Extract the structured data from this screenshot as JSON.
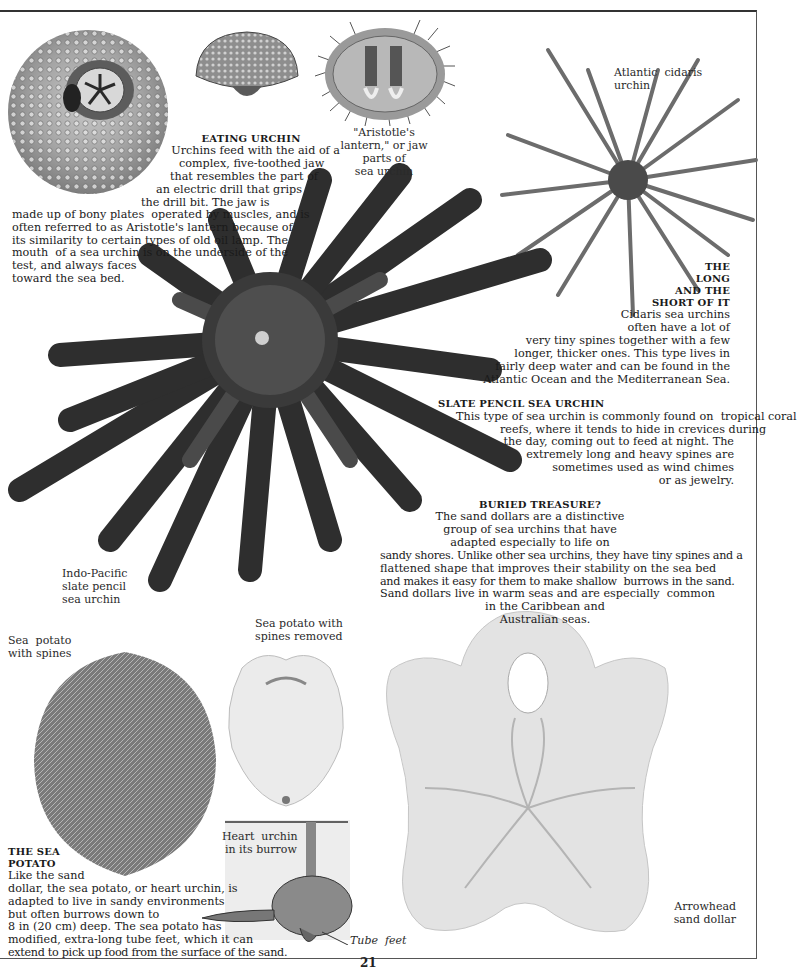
{
  "page": {
    "page_number": "21"
  },
  "eating_urchin": {
    "heading": "EATING URCHIN",
    "lines": [
      "Urchins feed with the aid of a",
      "complex, five-toothed jaw",
      "that resembles the part of",
      "an electric drill that grips",
      "the drill bit. The jaw is",
      "made up of bony plates  operated by muscles, and is",
      "often referred to as Aristotle's lantern because of",
      "its similarity to certain types of old oil lamp. The",
      "mouth  of a sea urchin is on the underside of the",
      "test, and always faces",
      "toward the sea bed."
    ]
  },
  "captions": {
    "aristotles_lantern": [
      "\"Aristotle's",
      "lantern,\" or jaw",
      "parts of",
      "sea urchin"
    ],
    "atlantic_cidaris": [
      "Atlantic  cidaris",
      "urchin"
    ],
    "indo_pacific": [
      "Indo-Pacific",
      "slate pencil",
      "sea urchin"
    ],
    "sea_potato_spines": [
      "Sea  potato",
      "with spines"
    ],
    "sea_potato_removed": [
      "Sea potato with",
      "spines removed"
    ],
    "heart_urchin": [
      "Heart  urchin",
      "in its burrow"
    ],
    "tube_feet": "Tube  feet",
    "arrowhead": [
      "Arrowhead",
      "sand dollar"
    ]
  },
  "long_and_short": {
    "heading": [
      "THE",
      "LONG",
      "AND THE",
      "SHORT OF IT"
    ],
    "lines": [
      "Cidaris sea urchins",
      "often have a lot of",
      "very tiny spines together with a few",
      "longer, thicker ones. This type lives in",
      "fairly deep water and can be found in the",
      "Atlantic Ocean and the Mediterranean Sea."
    ]
  },
  "slate_pencil": {
    "heading": "SLATE PENCIL SEA URCHIN",
    "lines": [
      "This type of sea urchin is commonly found on  tropical coral",
      "reefs, where it tends to hide in crevices during",
      "the day, coming out to feed at night. The",
      "extremely long and heavy spines are",
      "sometimes used as wind chimes",
      "or as jewelry."
    ]
  },
  "buried_treasure": {
    "heading": "BURIED TREASURE?",
    "lines": [
      "The sand dollars are a distinctive",
      "group of sea urchins that have",
      "adapted especially to life on",
      "sandy shores. Unlike other sea urchins, they have tiny spines and a",
      "flattened shape that improves their stability on the sea bed",
      "and makes it easy for them to make shallow  burrows in the sand.",
      "Sand dollars live in warm seas and are especially  common",
      "in the Caribbean and",
      "Australian seas."
    ]
  },
  "sea_potato": {
    "heading": [
      "THE SEA",
      "POTATO"
    ],
    "lines": [
      "Like the sand",
      "dollar, the sea potato, or heart urchin, is",
      "adapted to live in sandy environments",
      "but often burrows down to",
      "8 in (20 cm) deep. The sea potato has",
      "modified, extra-long tube feet, which it can",
      "extend to pick up food from the surface of the sand."
    ]
  }
}
